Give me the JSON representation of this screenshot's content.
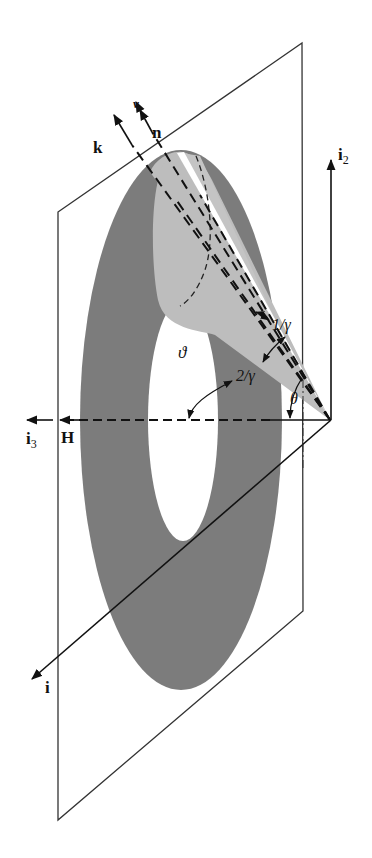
{
  "diagram": {
    "type": "3d-geometry",
    "labels": {
      "k": "k",
      "v": "v",
      "n": "n",
      "i2_main": "i",
      "i2_sub": "2",
      "i3_main": "i",
      "i3_sub": "3",
      "H": "H",
      "i": "i",
      "theta_big": "ϑ",
      "theta_small": "θ",
      "one_over_gamma": "1/γ",
      "two_over_gamma": "2/γ"
    },
    "colors": {
      "ring": "#7a7a7a",
      "cone": "#bdbdbd",
      "highlight": "#ffffff",
      "line": "#222222",
      "background": "#ffffff"
    }
  }
}
